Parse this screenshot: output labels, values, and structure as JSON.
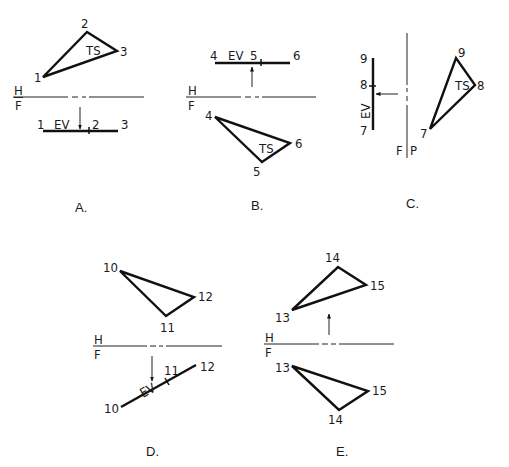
{
  "figure": {
    "panels": [
      {
        "id": "A",
        "caption": "A.",
        "fold_line": {
          "top": "H",
          "bottom": "F"
        },
        "triangle_view": {
          "label": "TS",
          "points": [
            "1",
            "2",
            "3"
          ]
        },
        "edge_view": {
          "label": "EV",
          "points": [
            "1",
            "2",
            "3"
          ]
        }
      },
      {
        "id": "B",
        "caption": "B.",
        "fold_line": {
          "top": "H",
          "bottom": "F"
        },
        "edge_view": {
          "label": "EV",
          "points": [
            "4",
            "5",
            "6"
          ]
        },
        "triangle_view": {
          "label": "TS",
          "points": [
            "4",
            "5",
            "6"
          ]
        }
      },
      {
        "id": "C",
        "caption": "C.",
        "fold_line": {
          "left": "F",
          "right": "P"
        },
        "edge_view": {
          "label": "EV",
          "points": [
            "9",
            "8",
            "7"
          ]
        },
        "triangle_view": {
          "label": "TS",
          "points": [
            "9",
            "8",
            "7"
          ]
        }
      },
      {
        "id": "D",
        "caption": "D.",
        "fold_line": {
          "top": "H",
          "bottom": "F"
        },
        "triangle_view": {
          "points": [
            "10",
            "11",
            "12"
          ]
        },
        "edge_view": {
          "label": "EV",
          "points": [
            "10",
            "11",
            "12"
          ]
        }
      },
      {
        "id": "E",
        "caption": "E.",
        "fold_line": {
          "top": "H",
          "bottom": "F"
        },
        "top_triangle": {
          "points": [
            "13",
            "14",
            "15"
          ]
        },
        "bottom_triangle": {
          "points": [
            "13",
            "14",
            "15"
          ]
        }
      }
    ]
  }
}
